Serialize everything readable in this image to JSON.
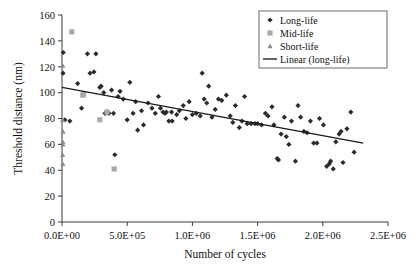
{
  "chart_data": {
    "type": "scatter",
    "title": "",
    "xlabel": "Number of cycles",
    "ylabel": "Threshold distance (nm)",
    "xlim": [
      0,
      2500000
    ],
    "ylim": [
      0,
      160
    ],
    "xticks": [
      0,
      500000,
      1000000,
      1500000,
      2000000,
      2500000
    ],
    "xticklabels": [
      "0.0E+00",
      "5.0E+05",
      "1.0E+06",
      "1.5E+06",
      "2.0E+06",
      "2.5E+06"
    ],
    "yticks": [
      0,
      20,
      40,
      60,
      80,
      100,
      120,
      140,
      160
    ],
    "yticklabels": [
      "0",
      "20",
      "40",
      "60",
      "80",
      "100",
      "120",
      "140",
      "160"
    ],
    "grid": false,
    "legend_position": "top-right",
    "legend": [
      {
        "label": "Long-life",
        "marker": "diamond",
        "color": "#2b2b2b"
      },
      {
        "label": "Mid-life",
        "marker": "square",
        "color": "#a9a9a9"
      },
      {
        "label": "Short-life",
        "marker": "triangle",
        "color": "#8c8c8c"
      },
      {
        "label": "Linear (long-life)",
        "marker": "line",
        "color": "#1a1a1a"
      }
    ],
    "series": [
      {
        "name": "Long-life",
        "marker": "diamond",
        "color": "#2b2b2b",
        "points": [
          [
            8000,
            115
          ],
          [
            10000,
            131
          ],
          [
            22000,
            79
          ],
          [
            60000,
            78
          ],
          [
            120000,
            107
          ],
          [
            150000,
            88
          ],
          [
            195000,
            130
          ],
          [
            215000,
            115
          ],
          [
            245000,
            116
          ],
          [
            260000,
            130
          ],
          [
            290000,
            104
          ],
          [
            300000,
            105
          ],
          [
            320000,
            100
          ],
          [
            330000,
            84
          ],
          [
            345000,
            85
          ],
          [
            360000,
            84
          ],
          [
            380000,
            102
          ],
          [
            395000,
            84
          ],
          [
            405000,
            52
          ],
          [
            430000,
            97
          ],
          [
            445000,
            101
          ],
          [
            470000,
            95
          ],
          [
            500000,
            79
          ],
          [
            520000,
            108
          ],
          [
            545000,
            84
          ],
          [
            565000,
            93
          ],
          [
            580000,
            71
          ],
          [
            610000,
            86
          ],
          [
            625000,
            75
          ],
          [
            660000,
            92
          ],
          [
            690000,
            88
          ],
          [
            715000,
            84
          ],
          [
            740000,
            97
          ],
          [
            755000,
            88
          ],
          [
            775000,
            85
          ],
          [
            790000,
            84
          ],
          [
            800000,
            85
          ],
          [
            820000,
            78
          ],
          [
            840000,
            85
          ],
          [
            845000,
            78
          ],
          [
            880000,
            83
          ],
          [
            900000,
            86
          ],
          [
            930000,
            90
          ],
          [
            950000,
            80
          ],
          [
            975000,
            93
          ],
          [
            1000000,
            83
          ],
          [
            1030000,
            84
          ],
          [
            1060000,
            82
          ],
          [
            1075000,
            115
          ],
          [
            1090000,
            95
          ],
          [
            1110000,
            92
          ],
          [
            1125000,
            105
          ],
          [
            1150000,
            81
          ],
          [
            1175000,
            87
          ],
          [
            1200000,
            95
          ],
          [
            1225000,
            94
          ],
          [
            1260000,
            98
          ],
          [
            1290000,
            82
          ],
          [
            1310000,
            77
          ],
          [
            1330000,
            90
          ],
          [
            1360000,
            73
          ],
          [
            1380000,
            78
          ],
          [
            1400000,
            97
          ],
          [
            1420000,
            76
          ],
          [
            1450000,
            76
          ],
          [
            1480000,
            76
          ],
          [
            1500000,
            76
          ],
          [
            1530000,
            75
          ],
          [
            1560000,
            84
          ],
          [
            1580000,
            82
          ],
          [
            1610000,
            89
          ],
          [
            1625000,
            75
          ],
          [
            1650000,
            49
          ],
          [
            1660000,
            48
          ],
          [
            1680000,
            68
          ],
          [
            1705000,
            81
          ],
          [
            1720000,
            66
          ],
          [
            1740000,
            60
          ],
          [
            1760000,
            78
          ],
          [
            1790000,
            47
          ],
          [
            1810000,
            90
          ],
          [
            1830000,
            81
          ],
          [
            1855000,
            70
          ],
          [
            1880000,
            69
          ],
          [
            1905000,
            78
          ],
          [
            1930000,
            61
          ],
          [
            1955000,
            61
          ],
          [
            1975000,
            80
          ],
          [
            2005000,
            75
          ],
          [
            2030000,
            43
          ],
          [
            2050000,
            45
          ],
          [
            2060000,
            47
          ],
          [
            2080000,
            41
          ],
          [
            2100000,
            62
          ],
          [
            2125000,
            68
          ],
          [
            2140000,
            70
          ],
          [
            2155000,
            46
          ],
          [
            2185000,
            72
          ],
          [
            2215000,
            85
          ],
          [
            2240000,
            54
          ]
        ]
      },
      {
        "name": "Mid-life",
        "marker": "square",
        "color": "#a9a9a9",
        "points": [
          [
            75000,
            147
          ],
          [
            160000,
            98
          ],
          [
            165000,
            99
          ],
          [
            290000,
            79
          ],
          [
            345000,
            85
          ],
          [
            400000,
            41
          ]
        ]
      },
      {
        "name": "Short-life",
        "marker": "triangle",
        "color": "#8c8c8c",
        "points": [
          [
            5000,
            121
          ],
          [
            5000,
            79
          ],
          [
            8000,
            70
          ],
          [
            6000,
            62
          ],
          [
            7000,
            60
          ],
          [
            5000,
            52
          ],
          [
            6000,
            45
          ]
        ]
      }
    ],
    "trendline": {
      "name": "Linear (long-life)",
      "x_start": 0,
      "y_start": 104,
      "x_end": 2310000,
      "y_end": 61,
      "color": "#1a1a1a"
    }
  }
}
